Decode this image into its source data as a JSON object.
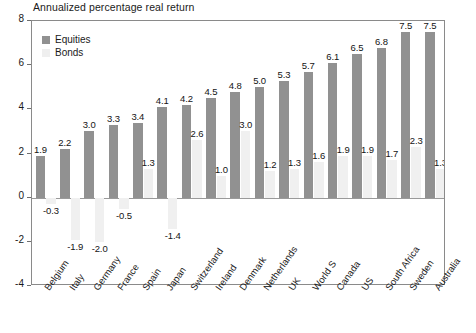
{
  "chart_data": {
    "type": "bar",
    "title": "Annualized percentage real return",
    "xlabel": "",
    "ylabel": "",
    "ylim": [
      -4,
      8
    ],
    "yticks": [
      8,
      6,
      4,
      2,
      0,
      -2,
      -4
    ],
    "ytick_labels": [
      "8",
      "6",
      "4",
      "2",
      "0",
      "-2",
      "-4"
    ],
    "grid": false,
    "legend_position": "top-left",
    "categories": [
      "Belgium",
      "Italy",
      "Germany",
      "France",
      "Spain",
      "Japan",
      "Switzerland",
      "Ireland",
      "Denmark",
      "Netherlands",
      "UK",
      "World S",
      "Canada",
      "US",
      "South Africa",
      "Sweden",
      "Australia"
    ],
    "series": [
      {
        "name": "Equities",
        "color": "#919191",
        "values": [
          1.9,
          2.2,
          3.0,
          3.3,
          3.4,
          4.1,
          4.2,
          4.5,
          4.8,
          5.0,
          5.3,
          5.7,
          6.1,
          6.5,
          6.8,
          7.5,
          7.5
        ],
        "labels": [
          "1.9",
          "2.2",
          "3.0",
          "3.3",
          "3.4",
          "4.1",
          "4.2",
          "4.5",
          "4.8",
          "5.0",
          "5.3",
          "5.7",
          "6.1",
          "6.5",
          "6.8",
          "7.5",
          "7.5"
        ]
      },
      {
        "name": "Bonds",
        "color": "#f0f0f0",
        "values": [
          -0.3,
          -1.9,
          -2.0,
          -0.5,
          1.3,
          -1.4,
          2.6,
          1.0,
          3.0,
          1.2,
          1.3,
          1.6,
          1.9,
          1.9,
          1.7,
          2.3,
          1.3
        ],
        "labels": [
          "-0.3",
          "-1.9",
          "-2.0",
          "-0.5",
          "1.3",
          "-1.4",
          "2.6",
          "1.0",
          "3.0",
          "1.2",
          "1.3",
          "1.6",
          "1.9",
          "1.9",
          "1.7",
          "2.3",
          "1.3"
        ]
      }
    ]
  },
  "legend": {
    "equities_label": "Equities",
    "bonds_label": "Bonds"
  }
}
